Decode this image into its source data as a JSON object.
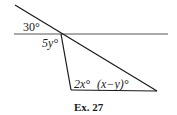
{
  "figure": {
    "caption": "Ex. 27",
    "angles": {
      "a30": "30°",
      "a5y": "5y°",
      "a2x": "2x°",
      "axy": "(x−y)°"
    },
    "lines": {
      "horizontal": {
        "x1": 14,
        "y1": 34,
        "x2": 168,
        "y2": 34
      },
      "transversal": {
        "x1": 15,
        "y1": 5,
        "x2": 157,
        "y2": 91
      },
      "side": {
        "x1": 61,
        "y1": 34,
        "x2": 71,
        "y2": 90
      },
      "base": {
        "x1": 71,
        "y1": 90,
        "x2": 157,
        "y2": 91
      }
    },
    "stroke_color": "#1a1a1a"
  }
}
